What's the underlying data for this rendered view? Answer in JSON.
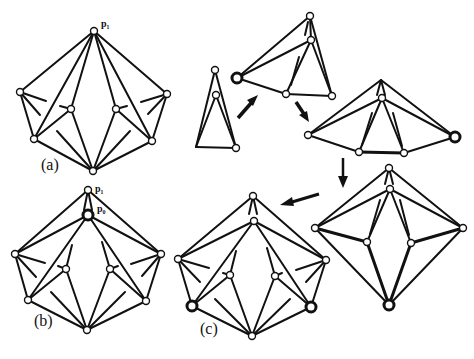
{
  "labels": {
    "panel_a": "(a)",
    "panel_b": "(b)",
    "panel_c": "(c)",
    "p1_a": "p₁",
    "p1_b": "p₁",
    "p0_b": "p₀"
  },
  "colors": {
    "stroke": "#111111",
    "background": "#ffffff",
    "vertex_fill": "#ffffff"
  }
}
